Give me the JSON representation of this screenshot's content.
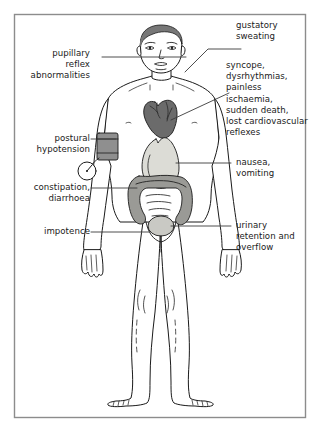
{
  "figure": {
    "border_color": "#8c8c8c",
    "background_color": "#ffffff"
  },
  "palette": {
    "outline": "#1a1a1a",
    "hair": "#777777",
    "heart": "#6b6b6b",
    "stomach": "#dcdcd6",
    "intestine": "#9a9a96",
    "bladder": "#c9c9c4",
    "cuff": "#8f8f8f",
    "leader_line": "#3a3a3a",
    "skin": "#ffffff"
  },
  "labels": [
    {
      "id": "pupillary",
      "side": "left",
      "text": "pupillary\nreflex\nabnormalities",
      "target": "eyes"
    },
    {
      "id": "postural-hypotension",
      "side": "left",
      "text": "postural\nhypotension",
      "target": "blood-pressure-cuff"
    },
    {
      "id": "constipation",
      "side": "left",
      "text": "constipation,\ndiarrhoea",
      "target": "large-intestine"
    },
    {
      "id": "impotence",
      "side": "left",
      "text": "impotence",
      "target": "groin"
    },
    {
      "id": "gustatory",
      "side": "right",
      "text": "gustatory\nsweating",
      "target": "face"
    },
    {
      "id": "cardiovascular",
      "side": "right",
      "text": "syncope,\ndysrhythmias,\npainless ischaemia,\nsudden death,\nlost cardiovascular\nreflexes",
      "target": "heart"
    },
    {
      "id": "nausea",
      "side": "right",
      "text": "nausea,\nvomiting",
      "target": "stomach"
    },
    {
      "id": "urinary",
      "side": "right",
      "text": "urinary\nretention and\noverflow",
      "target": "bladder"
    }
  ],
  "organs": [
    {
      "id": "heart",
      "name": "heart"
    },
    {
      "id": "stomach",
      "name": "stomach"
    },
    {
      "id": "large-intestine",
      "name": "large intestine"
    },
    {
      "id": "bladder",
      "name": "urinary bladder"
    }
  ],
  "devices": [
    {
      "id": "blood-pressure-cuff",
      "name": "blood pressure cuff with gauge"
    }
  ]
}
